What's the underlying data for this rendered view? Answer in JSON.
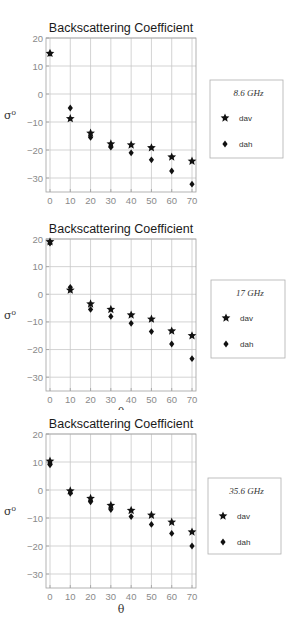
{
  "chart_data": [
    {
      "type": "scatter",
      "title": "Backscattering Coefficient",
      "xlabel": "θ",
      "ylabel": "σ⁰",
      "xlim": [
        0,
        70
      ],
      "ylim": [
        -35,
        20
      ],
      "xticks": [
        0,
        10,
        20,
        30,
        40,
        50,
        60,
        70
      ],
      "yticks": [
        20,
        10,
        0,
        -10,
        -20,
        -30
      ],
      "grid": true,
      "legend": {
        "title": "8.6 GHz",
        "position": "right"
      },
      "x": [
        0,
        10,
        20,
        30,
        40,
        50,
        60,
        70
      ],
      "series": [
        {
          "name": "dav",
          "marker": "star",
          "values": [
            14.5,
            -8.8,
            -14,
            -17.8,
            -18.2,
            -19.2,
            -22.5,
            -24
          ]
        },
        {
          "name": "dah",
          "marker": "diamond",
          "values": [
            14.5,
            -5,
            -15.5,
            -19,
            -21,
            -23.5,
            -27.5,
            -32.2
          ]
        }
      ]
    },
    {
      "type": "scatter",
      "title": "Backscattering Coefficient",
      "xlabel": "θ",
      "ylabel": "σ⁰",
      "xlim": [
        0,
        70
      ],
      "ylim": [
        -35,
        20
      ],
      "xticks": [
        0,
        10,
        20,
        30,
        40,
        50,
        60,
        70
      ],
      "yticks": [
        20,
        10,
        0,
        -10,
        -20,
        -30
      ],
      "grid": true,
      "legend": {
        "title": "17 GHz",
        "position": "right"
      },
      "x": [
        0,
        10,
        20,
        30,
        40,
        50,
        60,
        70
      ],
      "series": [
        {
          "name": "dav",
          "marker": "star",
          "values": [
            19,
            1.5,
            -3.5,
            -5.5,
            -7.5,
            -9,
            -13.3,
            -15
          ]
        },
        {
          "name": "dah",
          "marker": "diamond",
          "values": [
            18.5,
            2.5,
            -5.5,
            -8,
            -10.5,
            -13.5,
            -18,
            -23.3
          ]
        }
      ]
    },
    {
      "type": "scatter",
      "title": "Backscattering Coefficient",
      "xlabel": "θ",
      "ylabel": "σ⁰",
      "xlim": [
        0,
        70
      ],
      "ylim": [
        -35,
        20
      ],
      "xticks": [
        0,
        10,
        20,
        30,
        40,
        50,
        60,
        70
      ],
      "yticks": [
        20,
        10,
        0,
        -10,
        -20,
        -30
      ],
      "grid": true,
      "legend": {
        "title": "35.6 GHz",
        "position": "right"
      },
      "x": [
        0,
        10,
        20,
        30,
        40,
        50,
        60,
        70
      ],
      "series": [
        {
          "name": "dav",
          "marker": "star",
          "values": [
            10.3,
            -0.3,
            -3,
            -5.5,
            -7.3,
            -9,
            -11.5,
            -15
          ]
        },
        {
          "name": "dah",
          "marker": "diamond",
          "values": [
            9,
            -1.2,
            -4.2,
            -7,
            -9.5,
            -12.3,
            -15.5,
            -20
          ]
        }
      ]
    }
  ],
  "colors": {
    "grid": "#c8c8c8",
    "frame": "#a0a0a0",
    "marker": "#111111",
    "tick": "#8a8a8a",
    "legend_border": "#b0b0b0"
  }
}
